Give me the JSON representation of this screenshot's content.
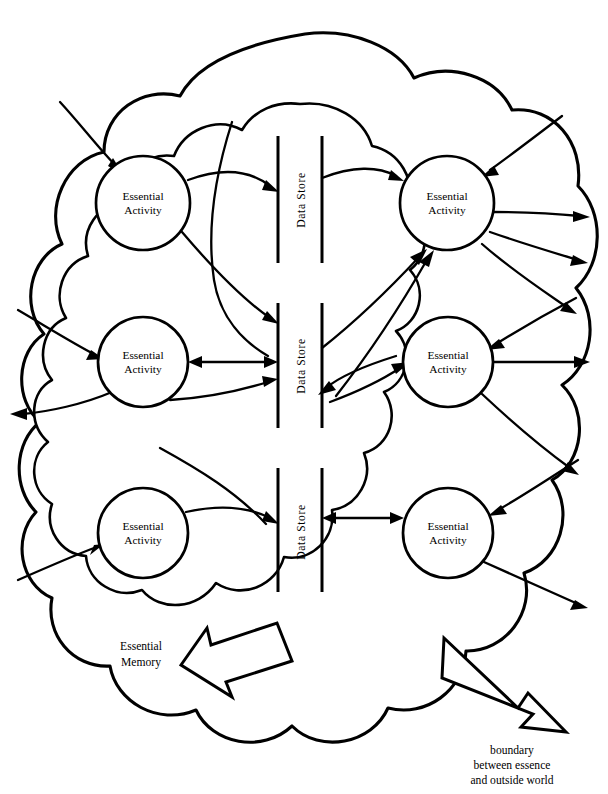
{
  "figure": {
    "title_fragment": "",
    "width": 608,
    "height": 794,
    "background_color": "#ffffff",
    "ink_color": "#000000"
  },
  "labels": {
    "activity": "Essential\nActivity",
    "activity_line1": "Essential",
    "activity_line2": "Activity",
    "data_store": "Data  Store",
    "essential_memory_line1": "Essential",
    "essential_memory_line2": "Memory",
    "boundary_line1": "boundary",
    "boundary_line2": "between essence",
    "boundary_line3": "and outside world"
  },
  "essential_activities": [
    {
      "id": "activity-top-left",
      "label_line1": "Essential",
      "label_line2": "Activity",
      "cx": 143,
      "cy": 203,
      "r": 47
    },
    {
      "id": "activity-top-right",
      "label_line1": "Essential",
      "label_line2": "Activity",
      "cx": 447,
      "cy": 203,
      "r": 47
    },
    {
      "id": "activity-middle-left",
      "label_line1": "Essential",
      "label_line2": "Activity",
      "cx": 143,
      "cy": 362,
      "r": 45
    },
    {
      "id": "activity-middle-right",
      "label_line1": "Essential",
      "label_line2": "Activity",
      "cx": 448,
      "cy": 362,
      "r": 45
    },
    {
      "id": "activity-bottom-left",
      "label_line1": "Essential",
      "label_line2": "Activity",
      "cx": 143,
      "cy": 533,
      "r": 45
    },
    {
      "id": "activity-bottom-right",
      "label_line1": "Essential",
      "label_line2": "Activity",
      "cx": 448,
      "cy": 533,
      "r": 45
    }
  ],
  "data_stores": [
    {
      "id": "data-store-top",
      "label": "Data  Store",
      "x_left": 278,
      "x_right": 322,
      "y_top": 136,
      "y_bottom": 263
    },
    {
      "id": "data-store-middle",
      "label": "Data  Store",
      "x_left": 278,
      "x_right": 322,
      "y_top": 303,
      "y_bottom": 428
    },
    {
      "id": "data-store-bottom",
      "label": "Data  Store",
      "x_left": 278,
      "x_right": 322,
      "y_top": 468,
      "y_bottom": 592
    }
  ],
  "callouts": [
    {
      "id": "essential-memory-callout",
      "line1": "Essential",
      "line2": "Memory",
      "x": 141,
      "y": 650,
      "points_to": "inner cloud"
    },
    {
      "id": "boundary-callout",
      "line1": "boundary",
      "line2": "between essence",
      "line3": "and outside world",
      "x": 512,
      "y": 754,
      "points_to": "outer cloud"
    }
  ],
  "counts": {
    "essential_activities": 6,
    "data_stores": 3,
    "block_arrows": 2
  }
}
